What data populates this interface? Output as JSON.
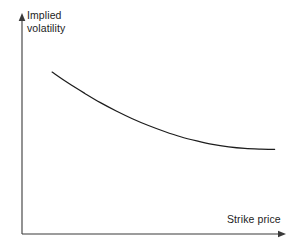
{
  "figure": {
    "background_color": "#ffffff",
    "line_color": "#1d1d1d",
    "axis_color": "#3a3a3a",
    "width": 297,
    "height": 247
  },
  "axes": {
    "y_axis_label_line1": "Implied",
    "y_axis_label_line2": "volatility",
    "x_axis_label": "Strike price",
    "y_axis_name": "y-axis-arrow",
    "x_axis_name": "x-axis-arrow"
  },
  "chart_data": {
    "type": "line",
    "title": "",
    "subtitle": "",
    "xlabel": "Strike price",
    "ylabel": "Implied volatility",
    "grid": false,
    "legend": false,
    "axis_ticks": false,
    "axis_arrows": true,
    "xlim": [
      0,
      1
    ],
    "ylim": [
      0,
      1
    ],
    "annotations": [],
    "series": [
      {
        "name": "Implied volatility skew",
        "description": "Downward sloping convex curve that flattens at high strike prices (volatility skew / smirk)",
        "x": [
          0.114,
          0.175,
          0.238,
          0.297,
          0.357,
          0.418,
          0.479,
          0.54,
          0.601,
          0.662,
          0.722,
          0.783,
          0.844,
          0.905,
          0.957
        ],
        "y": [
          0.736,
          0.686,
          0.639,
          0.597,
          0.559,
          0.524,
          0.493,
          0.466,
          0.442,
          0.423,
          0.407,
          0.396,
          0.389,
          0.386,
          0.385
        ]
      }
    ]
  }
}
